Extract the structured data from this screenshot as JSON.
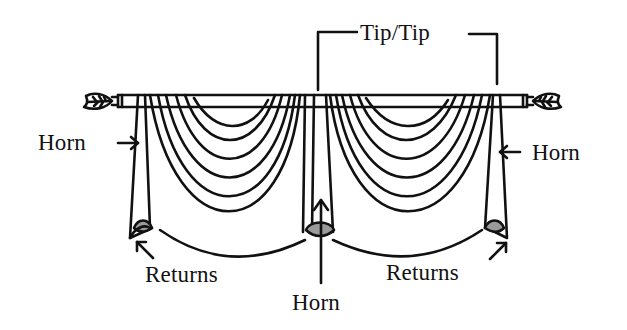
{
  "diagram": {
    "labels": {
      "tip_tip": "Tip/Tip",
      "horn_left": "Horn",
      "horn_right": "Horn",
      "horn_center": "Horn",
      "returns_left": "Returns",
      "returns_right": "Returns"
    },
    "parts": [
      "curtain-rod",
      "left-finial",
      "right-finial",
      "left-swag",
      "right-swag",
      "left-jabot",
      "center-jabot",
      "right-jabot"
    ],
    "colors": {
      "line": "#111111",
      "background": "#ffffff",
      "shading": "#9a9a9a"
    }
  }
}
